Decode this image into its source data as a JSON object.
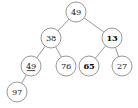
{
  "figure": {
    "type": "binary-tree-diagram",
    "background_color": "#ffffff",
    "node_fill": "#ffffff",
    "node_stroke": "#8d8d8d",
    "text_color": "#1a1a1a",
    "node_radius": 10.0
  },
  "tree": {
    "nodes": [
      {
        "id": "n0",
        "label": "49",
        "x": 76,
        "y": 12,
        "bold": false,
        "underline": false,
        "level": 0,
        "role": "root"
      },
      {
        "id": "n1",
        "label": "38",
        "x": 51,
        "y": 38,
        "bold": false,
        "underline": false,
        "level": 1,
        "role": "left-child"
      },
      {
        "id": "n2",
        "label": "13",
        "x": 112,
        "y": 38,
        "bold": true,
        "underline": false,
        "level": 1,
        "role": "right-child"
      },
      {
        "id": "n3",
        "label": "49",
        "x": 31,
        "y": 66,
        "bold": false,
        "underline": true,
        "level": 2,
        "role": "left-child"
      },
      {
        "id": "n4",
        "label": "76",
        "x": 66,
        "y": 66,
        "bold": false,
        "underline": false,
        "level": 2,
        "role": "right-child"
      },
      {
        "id": "n5",
        "label": "65",
        "x": 89,
        "y": 66,
        "bold": true,
        "underline": false,
        "level": 2,
        "role": "left-child"
      },
      {
        "id": "n6",
        "label": "27",
        "x": 122,
        "y": 66,
        "bold": false,
        "underline": false,
        "level": 2,
        "role": "right-child"
      },
      {
        "id": "n7",
        "label": "97",
        "x": 17,
        "y": 92,
        "bold": false,
        "underline": false,
        "level": 3,
        "role": "left-child"
      }
    ],
    "edges": [
      {
        "from": "n0",
        "to": "n1"
      },
      {
        "from": "n0",
        "to": "n2"
      },
      {
        "from": "n1",
        "to": "n3"
      },
      {
        "from": "n1",
        "to": "n4"
      },
      {
        "from": "n2",
        "to": "n5"
      },
      {
        "from": "n2",
        "to": "n6"
      },
      {
        "from": "n3",
        "to": "n7"
      }
    ]
  }
}
